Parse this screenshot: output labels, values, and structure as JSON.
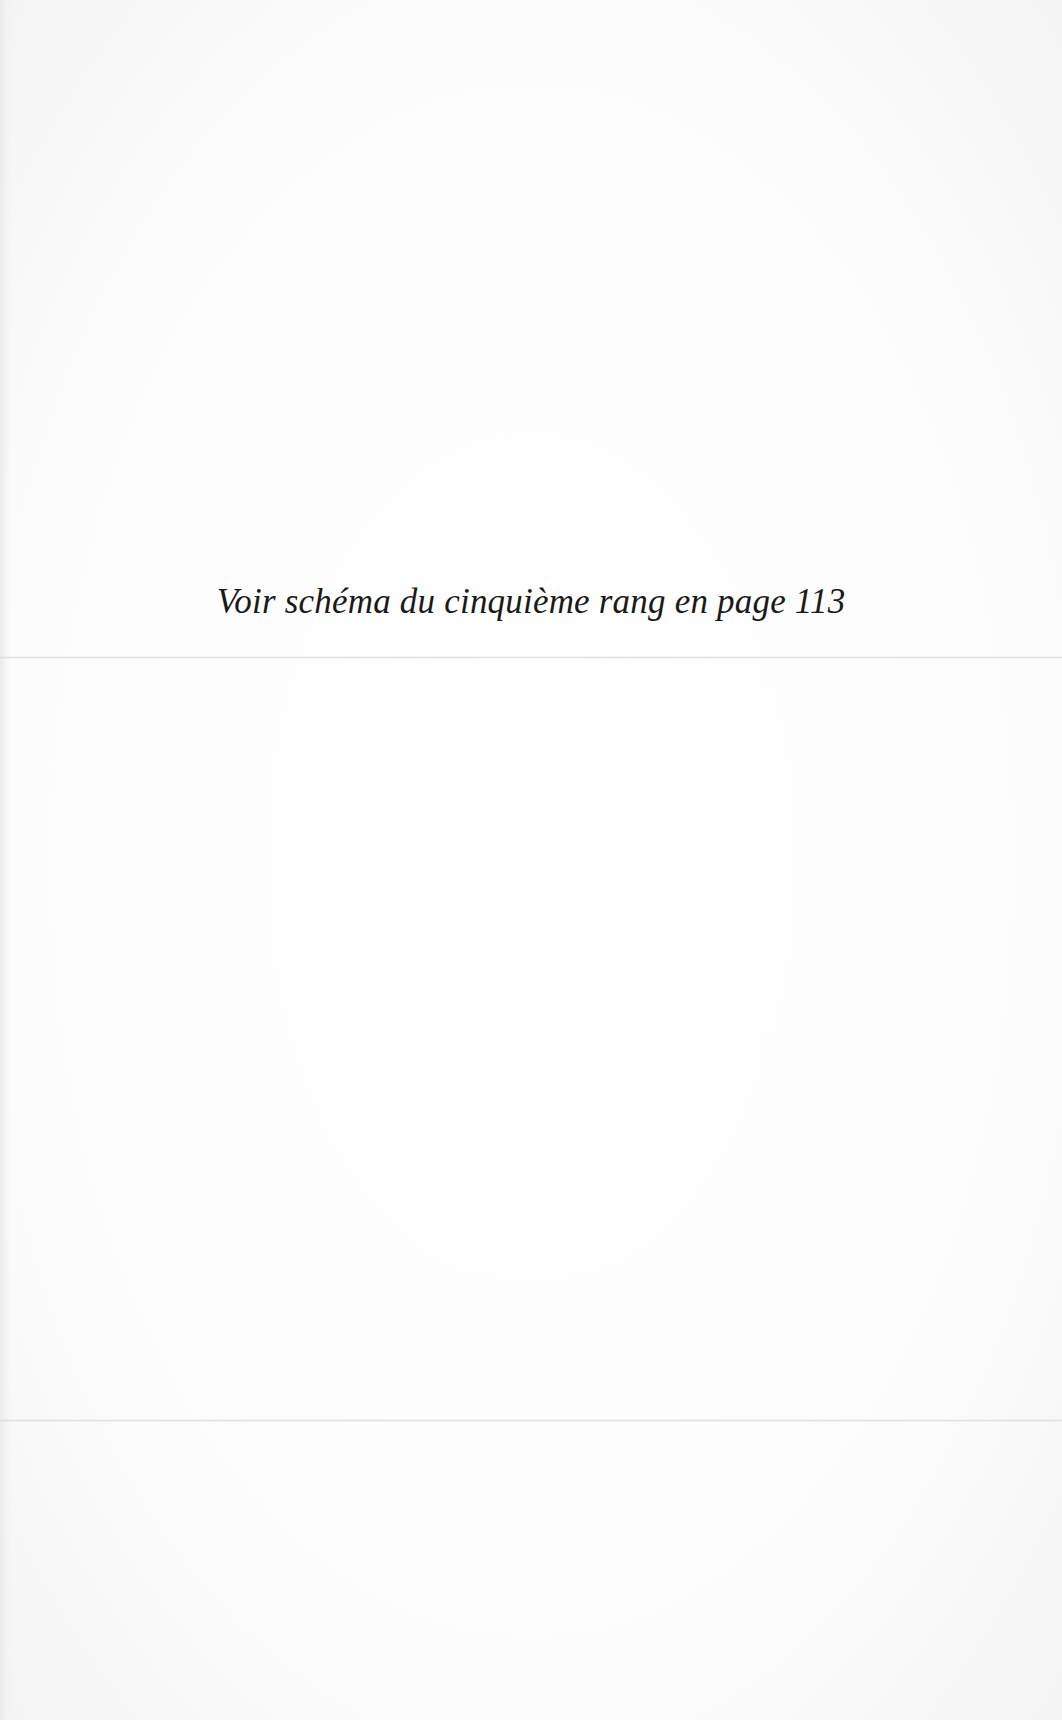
{
  "page": {
    "note_text": "Voir schéma du cinquième rang en page 113"
  }
}
